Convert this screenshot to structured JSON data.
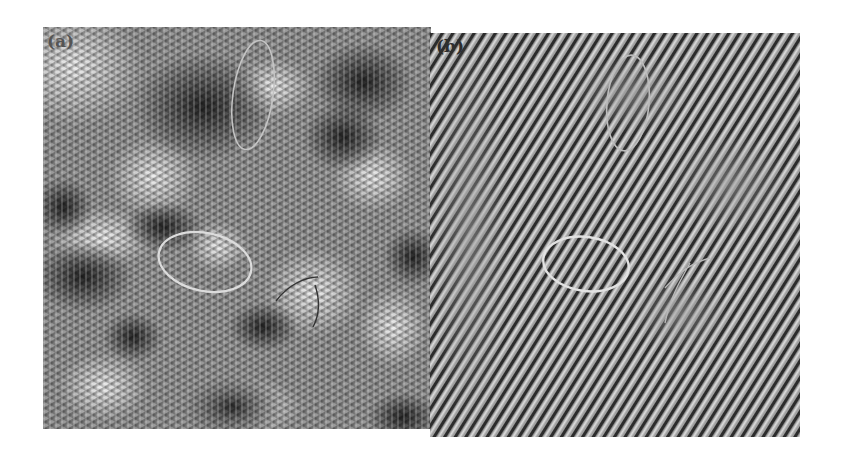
{
  "figure": {
    "panels": [
      {
        "id": "a",
        "label": "(a)",
        "description": "HRTEM lattice image with mottled contrast; crossed lattice fringes",
        "overlays": [
          {
            "type": "ellipse",
            "color": "#d8d8d8",
            "cx": 205,
            "cy": 262,
            "rx": 47,
            "ry": 30,
            "rotation": 12
          },
          {
            "type": "ellipse",
            "color": "#c8c8c8",
            "cx": 253,
            "cy": 95,
            "rx": 22,
            "ry": 55,
            "rotation": 8
          },
          {
            "type": "curve",
            "color": "#3a3a3a",
            "description": "dark boundary line near center-right"
          }
        ]
      },
      {
        "id": "b",
        "label": "(b)",
        "description": "Filtered image showing diagonal lattice fringes",
        "overlays": [
          {
            "type": "ellipse",
            "color": "#e0e0e0",
            "cx": 586,
            "cy": 264,
            "rx": 44,
            "ry": 28,
            "rotation": 8
          },
          {
            "type": "ellipse",
            "color": "#b8b8b8",
            "cx": 628,
            "cy": 100,
            "rx": 22,
            "ry": 50,
            "rotation": 5
          },
          {
            "type": "curve",
            "color": "#b0b0b0",
            "description": "faint boundary line on right"
          }
        ]
      }
    ],
    "colors": {
      "background": "#ffffff",
      "panel_gray": "#8a8a8a",
      "ellipse_light": "#e0e0e0"
    }
  }
}
